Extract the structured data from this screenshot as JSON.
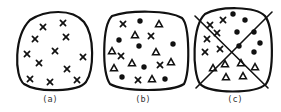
{
  "figure": {
    "panels": [
      {
        "id": "a",
        "label": "(a)",
        "outline": "M30,20 C45,10 72,8 84,22 C95,36 94,70 86,82 C78,92 38,93 24,84 C14,76 14,36 30,20 Z",
        "dividers": [],
        "crosses": [
          [
            43,
            27
          ],
          [
            63,
            23
          ],
          [
            35,
            39
          ],
          [
            66,
            37
          ],
          [
            27,
            54
          ],
          [
            55,
            51
          ],
          [
            83,
            57
          ],
          [
            39,
            63
          ],
          [
            67,
            69
          ],
          [
            30,
            79
          ],
          [
            50,
            82
          ],
          [
            77,
            80
          ]
        ],
        "dots": [],
        "triangles": []
      },
      {
        "id": "b",
        "label": "(b)",
        "outline": "M112,16 C130,10 168,10 182,18 C190,26 190,72 184,84 C172,92 124,92 110,84 C102,72 102,26 112,16 Z",
        "dividers": [],
        "crosses": [
          [
            123,
            24
          ],
          [
            151,
            36
          ],
          [
            121,
            56
          ],
          [
            160,
            65
          ],
          [
            138,
            80
          ]
        ],
        "dots": [
          [
            140,
            21
          ],
          [
            119,
            40
          ],
          [
            139,
            46
          ],
          [
            173,
            44
          ],
          [
            144,
            67
          ],
          [
            122,
            77
          ],
          [
            165,
            79
          ]
        ],
        "triangles": [
          [
            159,
            24
          ],
          [
            135,
            35
          ],
          [
            112,
            51
          ],
          [
            156,
            52
          ],
          [
            132,
            63
          ],
          [
            171,
            62
          ],
          [
            114,
            68
          ],
          [
            152,
            79
          ]
        ]
      },
      {
        "id": "c",
        "label": "(c)",
        "outline": "M205,14 C220,6 255,6 265,16 C274,28 274,72 266,84 C255,94 210,94 200,84 C192,72 192,26 205,14 Z",
        "dividers": [
          [
            [
              195,
              16
            ],
            [
              268,
              88
            ]
          ],
          [
            [
              272,
              12
            ],
            [
              196,
              88
            ]
          ]
        ],
        "crosses": [
          [
            210,
            25
          ],
          [
            223,
            20
          ],
          [
            207,
            39
          ],
          [
            217,
            33
          ],
          [
            205,
            52
          ],
          [
            220,
            49
          ]
        ],
        "dots": [
          [
            233,
            14
          ],
          [
            245,
            20
          ],
          [
            237,
            32
          ],
          [
            254,
            32
          ],
          [
            239,
            46
          ],
          [
            260,
            43
          ],
          [
            254,
            52
          ]
        ],
        "triangles": [
          [
            213,
            68
          ],
          [
            225,
            64
          ],
          [
            241,
            63
          ],
          [
            255,
            67
          ],
          [
            226,
            77
          ],
          [
            243,
            76
          ]
        ]
      }
    ],
    "labels_y": 102,
    "label_x": [
      50,
      143,
      235
    ]
  }
}
